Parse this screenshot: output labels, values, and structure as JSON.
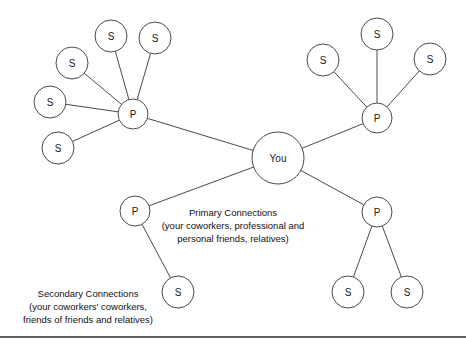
{
  "diagram": {
    "canvas": {
      "width": 466,
      "height": 347
    },
    "colors": {
      "background": "#ffffff",
      "stroke": "#4a4a4a",
      "text": "#111111",
      "frame_rule": "#2b2b2b"
    },
    "nodes": [
      {
        "id": "you",
        "label": "You",
        "kind": "center",
        "cx": 278,
        "cy": 158,
        "r": 26
      },
      {
        "id": "p-tl",
        "label": "P",
        "kind": "primary",
        "cx": 133,
        "cy": 114,
        "r": 15
      },
      {
        "id": "p-tr",
        "label": "P",
        "kind": "primary",
        "cx": 377,
        "cy": 118,
        "r": 15
      },
      {
        "id": "p-bl",
        "label": "P",
        "kind": "primary",
        "cx": 135,
        "cy": 211,
        "r": 15
      },
      {
        "id": "p-br",
        "label": "P",
        "kind": "primary",
        "cx": 377,
        "cy": 212,
        "r": 15
      },
      {
        "id": "s-tl-1",
        "label": "S",
        "kind": "secondary",
        "cx": 111,
        "cy": 36,
        "r": 16
      },
      {
        "id": "s-tl-2",
        "label": "S",
        "kind": "secondary",
        "cx": 155,
        "cy": 38,
        "r": 16
      },
      {
        "id": "s-tl-3",
        "label": "S",
        "kind": "secondary",
        "cx": 72,
        "cy": 63,
        "r": 16
      },
      {
        "id": "s-tl-4",
        "label": "S",
        "kind": "secondary",
        "cx": 50,
        "cy": 102,
        "r": 16
      },
      {
        "id": "s-tl-5",
        "label": "S",
        "kind": "secondary",
        "cx": 58,
        "cy": 148,
        "r": 16
      },
      {
        "id": "s-tr-1",
        "label": "S",
        "kind": "secondary",
        "cx": 323,
        "cy": 60,
        "r": 16
      },
      {
        "id": "s-tr-2",
        "label": "S",
        "kind": "secondary",
        "cx": 377,
        "cy": 34,
        "r": 16
      },
      {
        "id": "s-tr-3",
        "label": "S",
        "kind": "secondary",
        "cx": 430,
        "cy": 59,
        "r": 16
      },
      {
        "id": "s-bl-1",
        "label": "S",
        "kind": "secondary",
        "cx": 178,
        "cy": 292,
        "r": 16
      },
      {
        "id": "s-br-1",
        "label": "S",
        "kind": "secondary",
        "cx": 348,
        "cy": 292,
        "r": 16
      },
      {
        "id": "s-br-2",
        "label": "S",
        "kind": "secondary",
        "cx": 407,
        "cy": 292,
        "r": 16
      }
    ],
    "edges": [
      {
        "from": "you",
        "to": "p-tl"
      },
      {
        "from": "you",
        "to": "p-tr"
      },
      {
        "from": "you",
        "to": "p-bl"
      },
      {
        "from": "you",
        "to": "p-br"
      },
      {
        "from": "p-tl",
        "to": "s-tl-1"
      },
      {
        "from": "p-tl",
        "to": "s-tl-2"
      },
      {
        "from": "p-tl",
        "to": "s-tl-3"
      },
      {
        "from": "p-tl",
        "to": "s-tl-4"
      },
      {
        "from": "p-tl",
        "to": "s-tl-5"
      },
      {
        "from": "p-tr",
        "to": "s-tr-1"
      },
      {
        "from": "p-tr",
        "to": "s-tr-2"
      },
      {
        "from": "p-tr",
        "to": "s-tr-3"
      },
      {
        "from": "p-bl",
        "to": "s-bl-1"
      },
      {
        "from": "p-br",
        "to": "s-br-1"
      },
      {
        "from": "p-br",
        "to": "s-br-2"
      }
    ],
    "captions": [
      {
        "id": "primary-caption",
        "x": 233,
        "y": 216,
        "line_height": 13,
        "lines": [
          "Primary Connections",
          "(your coworkers, professional and",
          "personal friends, relatives)"
        ]
      },
      {
        "id": "secondary-caption",
        "x": 88,
        "y": 297,
        "line_height": 13,
        "lines": [
          "Secondary Connections",
          "(your coworkers' coworkers,",
          "friends of friends and relatives)"
        ]
      }
    ],
    "frame": {
      "bottom_rule": {
        "x1": 0,
        "y1": 337,
        "x2": 466,
        "y2": 337
      }
    },
    "legend_keys": {
      "center_label": "You",
      "primary_key": "P",
      "secondary_key": "S"
    }
  }
}
